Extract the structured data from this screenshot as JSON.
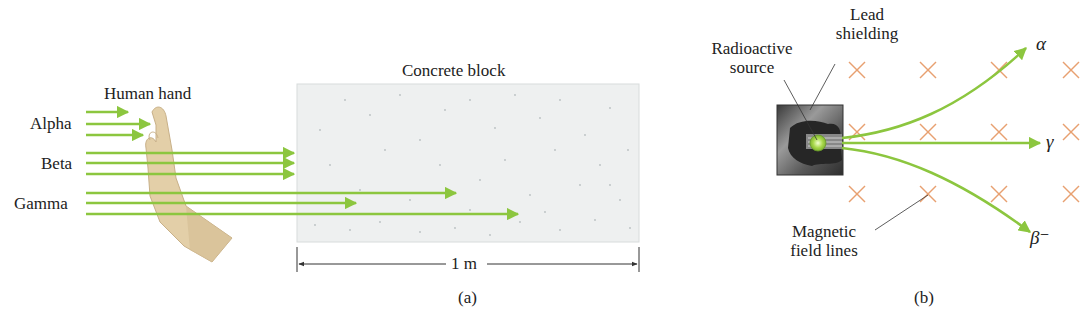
{
  "panel_a": {
    "caption": "(a)",
    "hand_label": "Human hand",
    "block_label": "Concrete block",
    "dimension_label": "1 m",
    "radiation_labels": [
      "Alpha",
      "Beta",
      "Gamma"
    ],
    "notes": {
      "alpha": "stopped by human hand",
      "beta": "passes hand, stopped at surface of concrete block",
      "gamma": "penetrates deep into concrete block"
    }
  },
  "panel_b": {
    "caption": "(b)",
    "source_label_line1": "Radioactive",
    "source_label_line2": "source",
    "shield_label_line1": "Lead",
    "shield_label_line2": "shielding",
    "field_label_line1": "Magnetic",
    "field_label_line2": "field lines",
    "beam_labels": {
      "alpha": "α",
      "gamma": "γ",
      "beta": "β⁻"
    }
  },
  "colors": {
    "ray": "#8cc63f",
    "field_x": "#e8a070",
    "concrete": "#eef0f0",
    "hand": "#e3cfa8",
    "shield": "#555555"
  }
}
